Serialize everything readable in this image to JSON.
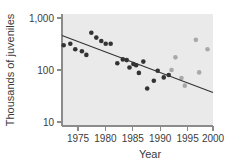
{
  "chart_data": {
    "type": "scatter",
    "title": "",
    "xlabel": "Year",
    "ylabel": "Thousands of juveniles",
    "xlim": [
      1973,
      2000.5
    ],
    "ylim": [
      10,
      1000
    ],
    "yscale": "log",
    "grid": false,
    "legend": "none",
    "xticks": [
      "1975",
      "1980",
      "1985",
      "1990",
      "1995",
      "2000"
    ],
    "xtick_values": [
      1975,
      1980,
      1985,
      1990,
      1995,
      2000
    ],
    "yticks": [
      "1,000",
      "100",
      "10"
    ],
    "ytick_values": [
      1000,
      100,
      10
    ],
    "series": [
      {
        "name": "observed-dark",
        "color": "#333333",
        "points": [
          {
            "x": 1973.3,
            "y": 300
          },
          {
            "x": 1974.5,
            "y": 320
          },
          {
            "x": 1975.4,
            "y": 250
          },
          {
            "x": 1976.6,
            "y": 230
          },
          {
            "x": 1977.4,
            "y": 195
          },
          {
            "x": 1978.3,
            "y": 520
          },
          {
            "x": 1979.2,
            "y": 420
          },
          {
            "x": 1980.1,
            "y": 360
          },
          {
            "x": 1980.9,
            "y": 320
          },
          {
            "x": 1981.8,
            "y": 320
          },
          {
            "x": 1983.0,
            "y": 135
          },
          {
            "x": 1984.0,
            "y": 160
          },
          {
            "x": 1984.7,
            "y": 155
          },
          {
            "x": 1985.2,
            "y": 112
          },
          {
            "x": 1985.9,
            "y": 130
          },
          {
            "x": 1986.4,
            "y": 123
          },
          {
            "x": 1986.9,
            "y": 88
          },
          {
            "x": 1987.7,
            "y": 145
          },
          {
            "x": 1988.4,
            "y": 44
          },
          {
            "x": 1989.6,
            "y": 62
          },
          {
            "x": 1990.3,
            "y": 97
          },
          {
            "x": 1991.4,
            "y": 72
          },
          {
            "x": 1992.3,
            "y": 80
          }
        ]
      },
      {
        "name": "observed-light",
        "color": "#a9a9a9",
        "points": [
          {
            "x": 1992.8,
            "y": 100
          },
          {
            "x": 1993.5,
            "y": 175
          },
          {
            "x": 1994.6,
            "y": 70
          },
          {
            "x": 1995.2,
            "y": 50
          },
          {
            "x": 1997.2,
            "y": 380
          },
          {
            "x": 1997.8,
            "y": 90
          },
          {
            "x": 1999.3,
            "y": 250
          }
        ]
      }
    ],
    "trend_line": {
      "name": "regression-line",
      "color": "#333333",
      "start": {
        "x": 1973.0,
        "y": 460
      },
      "end": {
        "x": 2000.3,
        "y": 37
      }
    }
  }
}
